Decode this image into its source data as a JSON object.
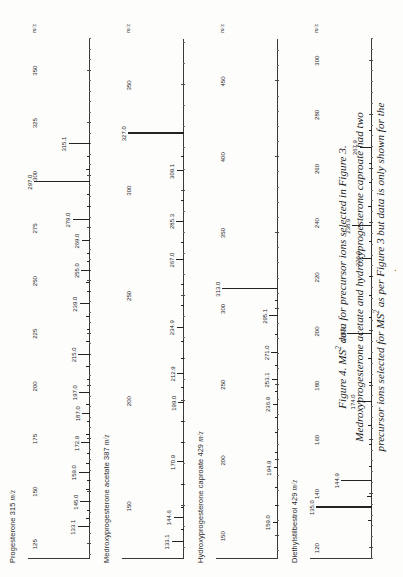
{
  "figure": {
    "caption_lines": [
      "Figure 4.  MS2 data for precursor ions selected in Figure 3.",
      "Medroxyprogesterone acetate and hydroxyprogesterone caproate had two",
      "precursor ions selected for MS2 as per Figure 3 but data is only shown for the",
      "[M+H]+ ion."
    ],
    "caption_label": "Figure 4.",
    "axis_title": "m/z"
  },
  "chart_data": [
    {
      "type": "bar",
      "title": "Progesterone 315 m/z",
      "analyte": "Progesterone",
      "precursor_mz": "315",
      "xlabel": "m/z",
      "ylabel": "",
      "xlim": [
        118,
        365
      ],
      "ticks": [
        125,
        150,
        175,
        200,
        225,
        250,
        275,
        300,
        325,
        350
      ],
      "labels": [
        "133.1",
        "145.0",
        "159.0",
        "172.9",
        "187.0",
        "197.0",
        "215.0",
        "239.0",
        "255.0",
        "269.0",
        "279.0",
        "297.0",
        "315.1"
      ],
      "x": [
        133.1,
        145.0,
        159.0,
        172.9,
        187.0,
        197.0,
        215.0,
        239.0,
        255.0,
        269.0,
        279.0,
        297.0,
        315.1
      ],
      "values": [
        22,
        17,
        20,
        16,
        14,
        19,
        21,
        18,
        16,
        15,
        31,
        100,
        38
      ],
      "extra_x": [
        137,
        141,
        151,
        155,
        163,
        168,
        177,
        183,
        191,
        203,
        209,
        221,
        227,
        233,
        245,
        249,
        259,
        263,
        285,
        291,
        303,
        309
      ],
      "extra_values": [
        7,
        6,
        8,
        6,
        7,
        6,
        8,
        6,
        7,
        6,
        7,
        8,
        6,
        7,
        6,
        7,
        6,
        5,
        6,
        5,
        7,
        6
      ]
    },
    {
      "type": "bar",
      "title": "Medroxyprogesterone acetate 387 m/z",
      "analyte": "Medroxyprogesterone acetate",
      "precursor_mz": "387",
      "xlabel": "m/z",
      "ylabel": "",
      "xlim": [
        125,
        372
      ],
      "ticks": [
        150,
        200,
        250,
        300,
        350
      ],
      "labels": [
        "133.1",
        "144.6",
        "170.9",
        "199.0",
        "212.9",
        "234.9",
        "267.0",
        "285.3",
        "309.1",
        "327.0"
      ],
      "x": [
        133.1,
        144.6,
        170.9,
        199.0,
        212.9,
        234.9,
        267.0,
        285.3,
        309.1,
        327.0
      ],
      "values": [
        22,
        18,
        12,
        10,
        12,
        13,
        14,
        14,
        13,
        100
      ],
      "extra_x": [
        139,
        149,
        160,
        180,
        190,
        206,
        220,
        228,
        245,
        255,
        275,
        295,
        316
      ],
      "extra_values": [
        6,
        6,
        5,
        5,
        5,
        6,
        5,
        5,
        5,
        5,
        6,
        6,
        6
      ]
    },
    {
      "type": "bar",
      "title": "Hydroxyprogesterone caproate 429 m/z",
      "analyte": "Hydroxyprogesterone caproate",
      "precursor_mz": "429",
      "xlabel": "m/z",
      "ylabel": "",
      "xlim": [
        135,
        478
      ],
      "ticks": [
        150,
        200,
        250,
        300,
        350,
        400,
        450
      ],
      "labels": [
        "159.0",
        "194.9",
        "236.9",
        "253.1",
        "271.0",
        "295.1",
        "313.0"
      ],
      "x": [
        159.0,
        194.9,
        236.9,
        253.1,
        271.0,
        295.1,
        313.0
      ],
      "values": [
        9,
        8,
        9,
        11,
        12,
        16,
        100
      ],
      "extra_x": [
        170,
        182,
        205,
        218,
        228,
        245,
        262,
        283,
        305
      ],
      "extra_values": [
        5,
        5,
        5,
        5,
        5,
        5,
        5,
        5,
        6
      ]
    },
    {
      "type": "bar",
      "title": "Diethylstilbestrol 429 m/z",
      "analyte": "Diethylstilbestrol",
      "precursor_mz": "429",
      "xlabel": "m/z",
      "ylabel": "",
      "xlim": [
        116,
        308
      ],
      "ticks": [
        120,
        140,
        160,
        180,
        200,
        220,
        240,
        260,
        280,
        300
      ],
      "labels": [
        "135.0",
        "144.9",
        "174.0",
        "198.9",
        "226.9",
        "238.9",
        "267.9"
      ],
      "x": [
        135.0,
        144.9,
        174.0,
        198.9,
        226.9,
        238.9,
        267.9
      ],
      "values": [
        100,
        55,
        26,
        44,
        17,
        35,
        22
      ],
      "extra_x": [
        130,
        139,
        150,
        158,
        165,
        181,
        190,
        205,
        213,
        220,
        233,
        246,
        255,
        262,
        274
      ],
      "extra_values": [
        8,
        9,
        6,
        6,
        7,
        6,
        7,
        6,
        6,
        6,
        6,
        7,
        6,
        6,
        5
      ]
    }
  ]
}
